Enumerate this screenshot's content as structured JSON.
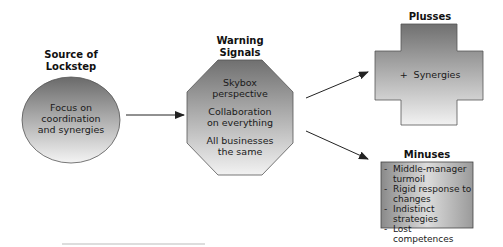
{
  "diagram": {
    "source": {
      "title_line1": "Source of",
      "title_line2": "Lockstep",
      "body_line1": "Focus on",
      "body_line2": "coordination",
      "body_line3": "and synergies"
    },
    "warning": {
      "title_line1": "Warning",
      "title_line2": "Signals",
      "items": [
        {
          "line1": "Skybox",
          "line2": "perspective"
        },
        {
          "line1": "Collaboration",
          "line2": "on everything"
        },
        {
          "line1": "All businesses",
          "line2": "the same"
        }
      ]
    },
    "plusses": {
      "title": "Plusses",
      "item": "+  Synergies"
    },
    "minuses": {
      "title": "Minuses",
      "bullet": "-",
      "items": [
        {
          "line1": "Middle-manager",
          "line2": "turmoil"
        },
        {
          "line1": "Rigid response to",
          "line2": "changes"
        },
        {
          "line1": "Indistinct strategies",
          "line2": ""
        },
        {
          "line1": "Lost competences",
          "line2": ""
        }
      ]
    },
    "colors": {
      "gradient_dark": "#6a6a6a",
      "gradient_light": "#f2f2f2",
      "outline": "#555555",
      "arrow": "#222222"
    }
  }
}
